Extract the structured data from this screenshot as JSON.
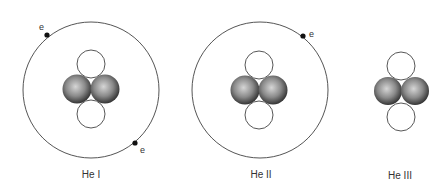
{
  "diagram": {
    "atoms": [
      {
        "label": "He I",
        "electrons": 2,
        "electron_label": "e"
      },
      {
        "label": "He II",
        "electrons": 1,
        "electron_label": "e"
      },
      {
        "label": "He III",
        "electrons": 0
      }
    ],
    "colors": {
      "orbit": "#555555",
      "electron": "#111111",
      "proton_highlight": "#d8d8d8",
      "proton_shadow": "#3a3a3a",
      "neutron_fill": "#ffffff",
      "neutron_stroke": "#444444"
    }
  }
}
